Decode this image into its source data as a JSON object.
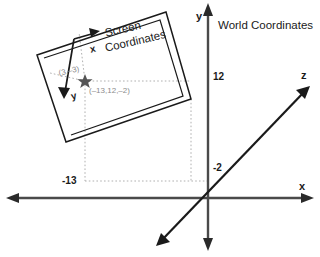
{
  "diagram": {
    "title": "World Coordinates",
    "world_axes": {
      "x_label": "x",
      "y_label": "y",
      "z_label": "z"
    },
    "ticks": {
      "y_tick": "12",
      "z_tick": "-2",
      "x_tick": "-13"
    },
    "screen_frame": {
      "title_line1": "Screen",
      "title_line2": "Coordinates",
      "x_label": "x",
      "y_label": "y"
    },
    "point": {
      "screen_coords": "(3,–3)",
      "world_coords": "(–13,12,–2)",
      "marker": "star-marker"
    },
    "colors": {
      "stroke": "#1a1a1a",
      "axis": "#4a4a4a",
      "dotted": "#b0b0b0",
      "coord_text": "#8c8c8c",
      "marker": "#555555"
    }
  }
}
